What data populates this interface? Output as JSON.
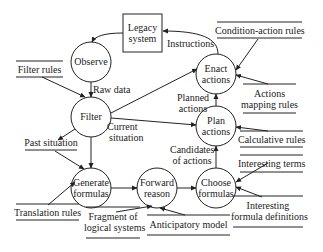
{
  "external_entities": [
    {
      "id": "legacy",
      "label": [
        "Legacy",
        "system"
      ]
    }
  ],
  "processes": [
    {
      "id": "observe",
      "label": [
        "Observe"
      ]
    },
    {
      "id": "filter",
      "label": [
        "Filter"
      ]
    },
    {
      "id": "generate",
      "label": [
        "Generate",
        "formulas"
      ]
    },
    {
      "id": "forward",
      "label": [
        "Forward",
        "reason"
      ]
    },
    {
      "id": "choose",
      "label": [
        "Choose",
        "formulas"
      ]
    },
    {
      "id": "plan",
      "label": [
        "Plan",
        "actions"
      ]
    },
    {
      "id": "enact",
      "label": [
        "Enact",
        "actions"
      ]
    }
  ],
  "data_stores": [
    {
      "id": "filter_rules",
      "label": [
        "Filter rules"
      ]
    },
    {
      "id": "past_situation",
      "label": [
        "Past situation"
      ]
    },
    {
      "id": "translation_rules",
      "label": [
        "Translation rules"
      ]
    },
    {
      "id": "fragment",
      "label": [
        "Fragment of",
        "logical systems"
      ]
    },
    {
      "id": "anticipatory",
      "label": [
        "Anticipatory model"
      ]
    },
    {
      "id": "condition_action",
      "label": [
        "Condition-action rules"
      ]
    },
    {
      "id": "actions_mapping",
      "label": [
        "Actions",
        "mapping rules"
      ]
    },
    {
      "id": "calculative",
      "label": [
        "Calculative rules"
      ]
    },
    {
      "id": "interesting_terms",
      "label": [
        "Interesting terms"
      ]
    },
    {
      "id": "interesting_formula",
      "label": [
        "Interesting",
        "formula definitions"
      ]
    }
  ],
  "flow_labels": {
    "raw_data": "Raw data",
    "current_situation": [
      "Current",
      "situation"
    ],
    "planned_actions": [
      "Planned",
      "actions"
    ],
    "candidates": [
      "Candidates",
      "of actions"
    ],
    "instructions": "Instructions"
  },
  "colors": {
    "line": "#222222",
    "background": "#ffffff"
  }
}
